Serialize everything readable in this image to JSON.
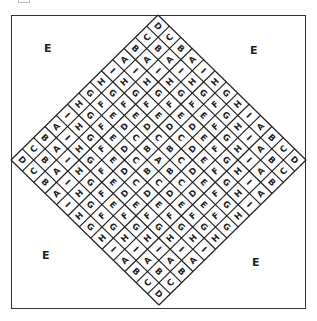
{
  "figure": {
    "corner_labels": [
      {
        "id": "top-left",
        "text": "E",
        "x": 44,
        "y": 42
      },
      {
        "id": "top-right",
        "text": "E",
        "x": 250,
        "y": 44
      },
      {
        "id": "bottom-left",
        "text": "E",
        "x": 42,
        "y": 249
      },
      {
        "id": "bottom-right",
        "text": "E",
        "x": 252,
        "y": 256
      }
    ],
    "grid": {
      "size": 13,
      "sequence": [
        "A",
        "B",
        "C",
        "D",
        "E",
        "F",
        "G",
        "H",
        "I",
        "A",
        "B",
        "C",
        "D"
      ],
      "rule": "letter = sequence[manhattan distance from center cell]",
      "center_letter": "A",
      "vertex_letter": "D"
    },
    "diamond": {
      "top": [
        158,
        15
      ],
      "right": [
        306,
        160
      ],
      "bottom": [
        158,
        309
      ],
      "left": [
        11,
        160
      ]
    },
    "colors": {
      "line": "#222222",
      "text": "#222222",
      "background": "#ffffff"
    }
  }
}
